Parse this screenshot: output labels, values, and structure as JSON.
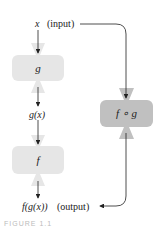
{
  "diagram": {
    "input_var": "x",
    "input_note": "(input)",
    "inner_func": "g",
    "intermediate": "g(x)",
    "outer_func": "f",
    "output_expr": "f(g(x))",
    "output_note": "(output)",
    "composite_func": "f ∘ g",
    "caption": "FIGURE 1.1"
  },
  "colors": {
    "light_box": "#e4e4e4",
    "dark_box": "#bcbcbc",
    "arrow": "#222222"
  }
}
